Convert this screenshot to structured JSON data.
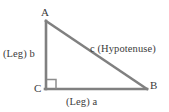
{
  "figure": {
    "background_color": "#ffffff",
    "line_color": "#808080",
    "text_color": "#3b3b3b",
    "width": 169,
    "height": 112
  },
  "diagram_data": {
    "type": "geometric-diagram",
    "shape": "right-triangle",
    "right_angle_at": "C",
    "vertices": [
      {
        "name": "A",
        "x": 46,
        "y": 21,
        "label": "A",
        "label_position": "above"
      },
      {
        "name": "B",
        "x": 147,
        "y": 89,
        "label": "B",
        "label_position": "right"
      },
      {
        "name": "C",
        "x": 46,
        "y": 89,
        "label": "C",
        "label_position": "left"
      }
    ],
    "sides": [
      {
        "name": "b",
        "from": "A",
        "to": "C",
        "label": "(Leg) b",
        "role": "leg",
        "orientation": "vertical"
      },
      {
        "name": "a",
        "from": "C",
        "to": "B",
        "label": "(Leg) a",
        "role": "leg",
        "orientation": "horizontal"
      },
      {
        "name": "c",
        "from": "A",
        "to": "B",
        "label": "c (Hypotenuse)",
        "role": "hypotenuse",
        "orientation": "diagonal"
      }
    ],
    "markers": [
      {
        "type": "right-angle-square",
        "at": "C",
        "size": 9
      }
    ]
  },
  "labels": {
    "vertex_a": "A",
    "vertex_b": "B",
    "vertex_c": "C",
    "leg_b": "(Leg) b",
    "leg_a": "(Leg) a",
    "hypotenuse": "c (Hypotenuse)"
  }
}
